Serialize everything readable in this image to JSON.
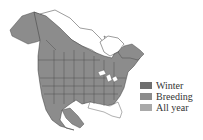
{
  "map": {
    "region": "North America",
    "colors": {
      "range": "#8c8c8c",
      "outline_fill": "#ffffff",
      "border": "#3a3a3a"
    }
  },
  "legend": {
    "items": [
      {
        "label": "Winter",
        "color": "#6f6f6f"
      },
      {
        "label": "Breeding",
        "color": "#8c8c8c"
      },
      {
        "label": "All year",
        "color": "#a9a9a9"
      }
    ]
  }
}
